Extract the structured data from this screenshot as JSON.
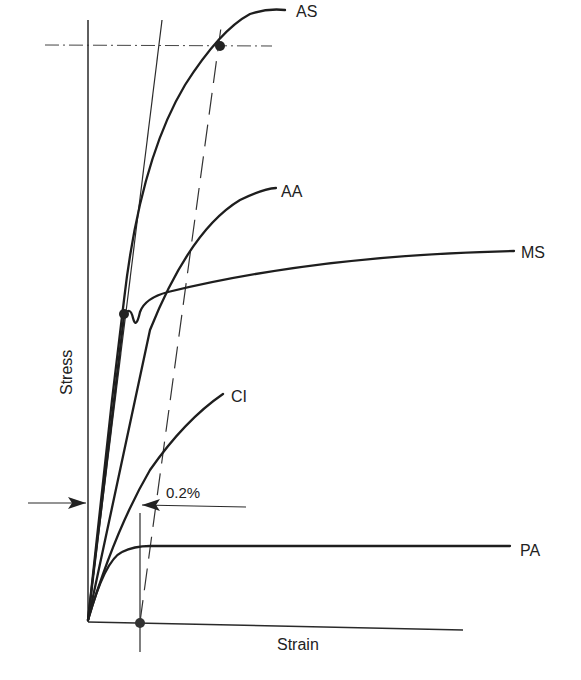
{
  "diagram": {
    "type": "stress-strain curves",
    "axes": {
      "x_label": "Strain",
      "y_label": "Stress"
    },
    "curves": [
      {
        "id": "AS",
        "label": "AS",
        "description": "high-strength curve with 0.2% proof point"
      },
      {
        "id": "AA",
        "label": "AA",
        "description": "curved, no distinct yield"
      },
      {
        "id": "MS",
        "label": "MS",
        "description": "linear then distinct yield drop, then gradual hardening"
      },
      {
        "id": "CI",
        "label": "CI",
        "description": "low curved, brittle end"
      },
      {
        "id": "PA",
        "label": "PA",
        "description": "low stiffness, flat plateau"
      }
    ],
    "annotations": {
      "offset_label": "0.2%",
      "offset_description": "0.2% strain offset line parallel to initial elastic slope",
      "markers": [
        {
          "id": "proof-stress-point",
          "on": "AS"
        },
        {
          "id": "yield-point",
          "on": "MS"
        },
        {
          "id": "offset-origin",
          "on": "strain-axis"
        }
      ]
    },
    "colors": {
      "ink": "#1e1e1e",
      "background": "#ffffff"
    }
  }
}
